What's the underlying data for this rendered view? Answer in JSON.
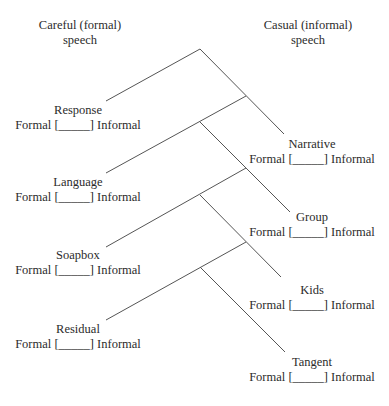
{
  "headers": {
    "left": [
      "Careful (formal)",
      "speech"
    ],
    "right": [
      "Casual (informal)",
      "speech"
    ]
  },
  "scale_text": "Formal [_____] Informal",
  "nodes": [
    {
      "name": "Response",
      "side": "left",
      "x": 78,
      "y": 103
    },
    {
      "name": "Narrative",
      "side": "right",
      "x": 312,
      "y": 137
    },
    {
      "name": "Language",
      "side": "left",
      "x": 78,
      "y": 175
    },
    {
      "name": "Group",
      "side": "right",
      "x": 312,
      "y": 210
    },
    {
      "name": "Soapbox",
      "side": "left",
      "x": 78,
      "y": 248
    },
    {
      "name": "Kids",
      "side": "right",
      "x": 312,
      "y": 283
    },
    {
      "name": "Residual",
      "side": "left",
      "x": 78,
      "y": 322
    },
    {
      "name": "Tangent",
      "side": "right",
      "x": 312,
      "y": 355
    }
  ],
  "colors": {
    "line": "#555555",
    "text": "#2b2b2b"
  }
}
